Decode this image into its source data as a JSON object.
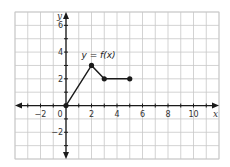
{
  "chart_data": {
    "type": "line",
    "title": "",
    "xlabel": "x",
    "ylabel": "y",
    "xlim": [
      -4,
      12
    ],
    "ylim": [
      -4,
      7
    ],
    "grid": true,
    "x_ticks": [
      -2,
      0,
      2,
      4,
      6,
      8,
      10
    ],
    "y_ticks": [
      -2,
      2,
      4,
      6
    ],
    "x_tick_labels": [
      "−2",
      "0",
      "2",
      "4",
      "6",
      "8",
      "10"
    ],
    "y_tick_labels": [
      "−2",
      "2",
      "4",
      "6"
    ],
    "series": [
      {
        "name": "y = f(x)",
        "points": [
          [
            0,
            0
          ],
          [
            2,
            3
          ],
          [
            3,
            2
          ],
          [
            5,
            2
          ]
        ],
        "markers": "closed-dots"
      }
    ],
    "annotations": [
      {
        "text": "y = f(x)",
        "x": 2,
        "y": 3.6
      }
    ]
  },
  "colors": {
    "grid": "#c8c8c8",
    "axis": "#1a1a1a",
    "series": "#1a1a1a",
    "background": "#ffffff"
  }
}
